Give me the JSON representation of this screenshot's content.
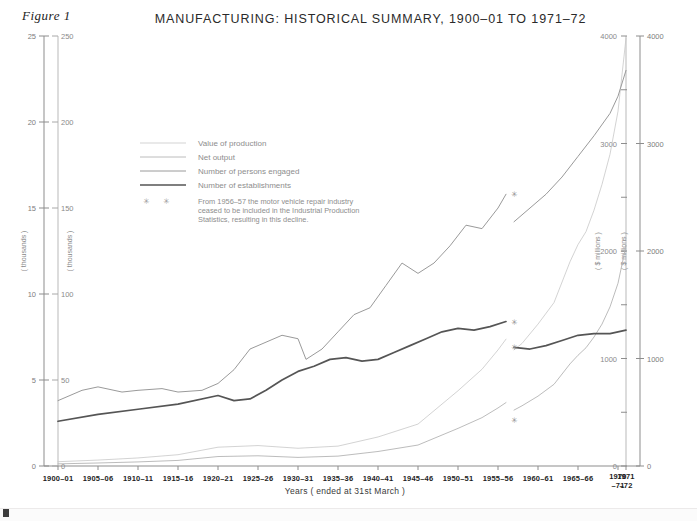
{
  "figure": {
    "caption": "Figure 1"
  },
  "header": {
    "title": "MANUFACTURING: HISTORICAL SUMMARY, 1900–01 TO 1971–72"
  },
  "axes": {
    "left_outer": {
      "unit": "( thousands )",
      "ticks": [
        "0",
        "5",
        "10",
        "15",
        "20",
        "25"
      ],
      "min": 0,
      "max": 25
    },
    "left_inner": {
      "unit": "( thousands )",
      "ticks": [
        "0",
        "50",
        "100",
        "150",
        "200",
        "250"
      ],
      "min": 0,
      "max": 250
    },
    "right_inner": {
      "unit": "( $ millions )",
      "ticks": [
        "0",
        "1000",
        "2000",
        "3000",
        "4000"
      ],
      "min": 0,
      "max": 4000
    },
    "right_outer": {
      "unit": "( $ millions )",
      "ticks": [
        "0",
        "1000",
        "2000",
        "3000",
        "4000"
      ],
      "min": 0,
      "max": 4000
    },
    "x": {
      "title": "Years ( ended at 31st March )",
      "labels": [
        "1900–01",
        "1905–06",
        "1910–11",
        "1915–16",
        "1920–21",
        "1925–26",
        "1930–31",
        "1935–36",
        "1940–41",
        "1945–46",
        "1950–51",
        "1955–56",
        "1960–61",
        "1965–66"
      ],
      "tail_labels": [
        {
          "line1": "1970",
          "line2": "–71"
        },
        {
          "line1": "1971",
          "line2": "–72"
        }
      ]
    }
  },
  "legend": {
    "items": [
      {
        "label": "Value of production",
        "color": "#c8c8c8",
        "width": 0.8
      },
      {
        "label": "Net output",
        "color": "#b4b4b4",
        "width": 0.9
      },
      {
        "label": "Number of persons engaged",
        "color": "#9a9a9a",
        "width": 1.0
      },
      {
        "label": "Number of establishments",
        "color": "#555555",
        "width": 1.7
      }
    ],
    "marker_symbol": "✳",
    "note_lines": [
      "From 1956–57 the motor vehicle repair industry",
      "ceased to be included in the Industrial Production",
      "Statistics, resulting in this decline."
    ]
  },
  "chart_data": {
    "type": "line",
    "title": "MANUFACTURING: HISTORICAL SUMMARY, 1900–01 TO 1971–72",
    "xlabel": "Years ( ended at 31st March )",
    "ylabel": "( thousands ) / ( $ millions )",
    "grid": false,
    "legend_position": "inside-upper-left",
    "x_start_year": 1900,
    "x_end_year": 1971,
    "break_year": 1956,
    "break_note": "From 1956-57 the motor vehicle repair industry ceased to be included in the Industrial Production Statistics, resulting in this decline.",
    "series": [
      {
        "name": "Value of production",
        "unit": "$ millions",
        "axis": "right",
        "ymax": 4000,
        "color": "#c8c8c8",
        "width": 0.8,
        "points_pre": [
          [
            1900,
            40
          ],
          [
            1905,
            55
          ],
          [
            1910,
            75
          ],
          [
            1915,
            105
          ],
          [
            1920,
            175
          ],
          [
            1925,
            190
          ],
          [
            1930,
            165
          ],
          [
            1935,
            185
          ],
          [
            1940,
            270
          ],
          [
            1945,
            390
          ],
          [
            1950,
            700
          ],
          [
            1953,
            900
          ],
          [
            1955,
            1080
          ],
          [
            1956,
            1180
          ]
        ],
        "points_post": [
          [
            1957,
            1080
          ],
          [
            1958,
            1140
          ],
          [
            1960,
            1320
          ],
          [
            1962,
            1520
          ],
          [
            1964,
            1900
          ],
          [
            1965,
            2060
          ],
          [
            1966,
            2180
          ],
          [
            1967,
            2380
          ],
          [
            1968,
            2620
          ],
          [
            1969,
            2900
          ],
          [
            1970,
            3300
          ],
          [
            1971,
            3980
          ]
        ]
      },
      {
        "name": "Net output",
        "unit": "$ millions",
        "axis": "right",
        "ymax": 4000,
        "color": "#b4b4b4",
        "width": 0.9,
        "points_pre": [
          [
            1900,
            20
          ],
          [
            1905,
            28
          ],
          [
            1910,
            38
          ],
          [
            1915,
            52
          ],
          [
            1920,
            88
          ],
          [
            1925,
            95
          ],
          [
            1930,
            80
          ],
          [
            1935,
            92
          ],
          [
            1940,
            135
          ],
          [
            1945,
            195
          ],
          [
            1950,
            350
          ],
          [
            1953,
            450
          ],
          [
            1955,
            540
          ],
          [
            1956,
            590
          ]
        ],
        "points_post": [
          [
            1957,
            520
          ],
          [
            1958,
            560
          ],
          [
            1960,
            650
          ],
          [
            1962,
            760
          ],
          [
            1964,
            950
          ],
          [
            1965,
            1030
          ],
          [
            1966,
            1100
          ],
          [
            1967,
            1200
          ],
          [
            1968,
            1320
          ],
          [
            1969,
            1480
          ],
          [
            1970,
            1700
          ],
          [
            1971,
            2050
          ]
        ]
      },
      {
        "name": "Number of persons engaged",
        "unit": "thousands",
        "axis": "left-inner",
        "ymax": 250,
        "color": "#9a9a9a",
        "width": 1.0,
        "points_pre": [
          [
            1900,
            38
          ],
          [
            1903,
            44
          ],
          [
            1905,
            46
          ],
          [
            1908,
            43
          ],
          [
            1910,
            44
          ],
          [
            1913,
            45
          ],
          [
            1915,
            43
          ],
          [
            1918,
            44
          ],
          [
            1920,
            48
          ],
          [
            1922,
            56
          ],
          [
            1924,
            68
          ],
          [
            1926,
            72
          ],
          [
            1928,
            76
          ],
          [
            1930,
            74
          ],
          [
            1931,
            62
          ],
          [
            1933,
            68
          ],
          [
            1935,
            78
          ],
          [
            1937,
            88
          ],
          [
            1939,
            92
          ],
          [
            1941,
            105
          ],
          [
            1943,
            118
          ],
          [
            1945,
            112
          ],
          [
            1947,
            118
          ],
          [
            1949,
            128
          ],
          [
            1951,
            140
          ],
          [
            1953,
            138
          ],
          [
            1955,
            150
          ],
          [
            1956,
            158
          ]
        ],
        "points_post": [
          [
            1957,
            142
          ],
          [
            1959,
            150
          ],
          [
            1961,
            158
          ],
          [
            1963,
            168
          ],
          [
            1965,
            180
          ],
          [
            1967,
            192
          ],
          [
            1969,
            205
          ],
          [
            1970,
            215
          ],
          [
            1971,
            230
          ]
        ]
      },
      {
        "name": "Number of establishments",
        "unit": "thousands",
        "axis": "left-outer",
        "ymax": 25,
        "color": "#555555",
        "width": 1.7,
        "points_pre": [
          [
            1900,
            2.6
          ],
          [
            1905,
            3.0
          ],
          [
            1910,
            3.3
          ],
          [
            1915,
            3.6
          ],
          [
            1920,
            4.1
          ],
          [
            1922,
            3.8
          ],
          [
            1924,
            3.9
          ],
          [
            1926,
            4.4
          ],
          [
            1928,
            5.0
          ],
          [
            1930,
            5.5
          ],
          [
            1932,
            5.8
          ],
          [
            1934,
            6.2
          ],
          [
            1936,
            6.3
          ],
          [
            1938,
            6.1
          ],
          [
            1940,
            6.2
          ],
          [
            1942,
            6.6
          ],
          [
            1944,
            7.0
          ],
          [
            1946,
            7.4
          ],
          [
            1948,
            7.8
          ],
          [
            1950,
            8.0
          ],
          [
            1952,
            7.9
          ],
          [
            1954,
            8.1
          ],
          [
            1956,
            8.4
          ]
        ],
        "points_post": [
          [
            1957,
            6.9
          ],
          [
            1959,
            6.8
          ],
          [
            1961,
            7.0
          ],
          [
            1963,
            7.3
          ],
          [
            1965,
            7.6
          ],
          [
            1967,
            7.7
          ],
          [
            1969,
            7.7
          ],
          [
            1970,
            7.8
          ],
          [
            1971,
            7.9
          ]
        ]
      }
    ],
    "break_markers": [
      {
        "x_year": 1957,
        "value": 158,
        "axis": "left-inner",
        "series": "Number of persons engaged"
      },
      {
        "x_year": 1957,
        "value": 8.4,
        "axis": "left-outer",
        "series": "Number of establishments"
      },
      {
        "x_year": 1957,
        "value": 6.9,
        "axis": "left-outer",
        "series": "Number of establishments"
      },
      {
        "x_year": 1957,
        "value": 430,
        "axis": "right",
        "series": "Net output"
      }
    ]
  }
}
